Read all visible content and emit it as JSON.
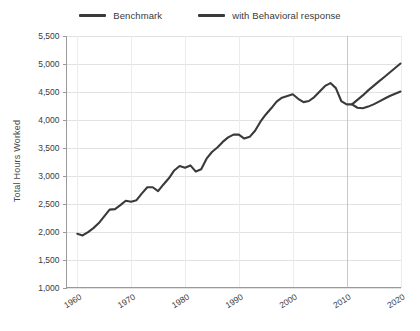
{
  "chart_data": {
    "type": "line",
    "title": "",
    "xlabel": "",
    "ylabel": "Total Hours Worked",
    "xlim": [
      1958,
      2020
    ],
    "ylim": [
      1000,
      5500
    ],
    "grid": true,
    "legend_position": "top-center",
    "x_ticks": [
      "1960",
      "1970",
      "1980",
      "1990",
      "2000",
      "2010",
      "2020"
    ],
    "x_tick_values": [
      1960,
      1970,
      1980,
      1990,
      2000,
      2010,
      2020
    ],
    "y_ticks": [
      "1,000",
      "1,500",
      "2,000",
      "2,500",
      "3,000",
      "3,500",
      "4,000",
      "4,500",
      "5,000",
      "5,500"
    ],
    "y_tick_values": [
      1000,
      1500,
      2000,
      2500,
      3000,
      3500,
      4000,
      4500,
      5000,
      5500
    ],
    "series": [
      {
        "name": "Benchmark",
        "color": "#3a3a3a",
        "x": [
          1960,
          1961,
          1962,
          1963,
          1964,
          1965,
          1966,
          1967,
          1968,
          1969,
          1970,
          1971,
          1972,
          1973,
          1974,
          1975,
          1976,
          1977,
          1978,
          1979,
          1980,
          1981,
          1982,
          1983,
          1984,
          1985,
          1986,
          1987,
          1988,
          1989,
          1990,
          1991,
          1992,
          1993,
          1994,
          1995,
          1996,
          1997,
          1998,
          1999,
          2000,
          2001,
          2002,
          2003,
          2004,
          2005,
          2006,
          2007,
          2008,
          2009,
          2010,
          2011,
          2012,
          2013,
          2014,
          2015,
          2016,
          2017,
          2018,
          2019,
          2020
        ],
        "values": [
          1960,
          1930,
          1990,
          2060,
          2150,
          2270,
          2390,
          2400,
          2470,
          2550,
          2530,
          2560,
          2680,
          2790,
          2790,
          2720,
          2840,
          2950,
          3090,
          3170,
          3140,
          3180,
          3070,
          3110,
          3300,
          3420,
          3500,
          3600,
          3680,
          3730,
          3730,
          3660,
          3690,
          3800,
          3960,
          4090,
          4200,
          4320,
          4390,
          4420,
          4450,
          4370,
          4310,
          4330,
          4400,
          4500,
          4600,
          4650,
          4560,
          4330,
          4270,
          4270,
          4350,
          4430,
          4520,
          4600,
          4680,
          4760,
          4840,
          4920,
          5000
        ]
      },
      {
        "name": "with Behavioral response",
        "color": "#3a3a3a",
        "x": [
          2011,
          2012,
          2013,
          2014,
          2015,
          2016,
          2017,
          2018,
          2019,
          2020
        ],
        "values": [
          4270,
          4210,
          4200,
          4230,
          4270,
          4320,
          4370,
          4420,
          4460,
          4500
        ]
      }
    ]
  },
  "legend": {
    "entries": [
      {
        "label": "Benchmark",
        "swatch_name": "legend-swatch-benchmark"
      },
      {
        "label": "with Behavioral response",
        "swatch_name": "legend-swatch-behavioral"
      }
    ]
  },
  "axes": {
    "y_title": "Total Hours Worked"
  },
  "colors": {
    "line": "#3a3a3a",
    "grid": "#e2e2e2",
    "grid_emphasis": "#c8c8c8",
    "axis": "#9a9a9a",
    "text": "#3a3a3a",
    "background": "#ffffff"
  }
}
